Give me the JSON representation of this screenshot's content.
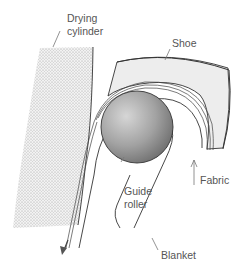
{
  "diagram": {
    "labels": {
      "drying_cylinder_1": "Drying",
      "drying_cylinder_2": "cylinder",
      "shoe": "Shoe",
      "guide_roller_1": "Guide",
      "guide_roller_2": "roller",
      "fabric": "Fabric",
      "blanket": "Blanket"
    },
    "colors": {
      "outline": "#333333",
      "leader": "#777777",
      "shoe_fill": "#efefef",
      "roller_dark": "#6e6e6e",
      "roller_light": "#d8d8d8"
    }
  }
}
